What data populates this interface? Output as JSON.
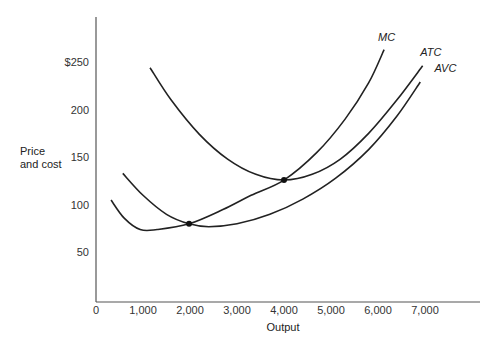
{
  "chart_data": {
    "type": "line",
    "title": "",
    "xlabel": "Output",
    "ylabel": "Price\nand cost",
    "ylabel_lines": [
      "Price",
      "and cost"
    ],
    "xlim": [
      0,
      8000
    ],
    "ylim": [
      0,
      290
    ],
    "grid": false,
    "legend": "none (curves labeled directly at their upper ends)",
    "x_ticks": [
      0,
      1000,
      2000,
      3000,
      4000,
      5000,
      6000,
      7000
    ],
    "x_tick_labels": [
      "0",
      "1,000",
      "2,000",
      "3,000",
      "4,000",
      "5,000",
      "6,000",
      "7,000"
    ],
    "y_ticks": [
      50,
      100,
      150,
      200,
      250
    ],
    "y_tick_labels": [
      "50",
      "100",
      "150",
      "200",
      "$250"
    ],
    "series": [
      {
        "name": "MC",
        "points": [
          [
            320,
            105
          ],
          [
            600,
            86
          ],
          [
            940,
            74
          ],
          [
            1300,
            74
          ],
          [
            1980,
            80
          ],
          [
            2700,
            95
          ],
          [
            3300,
            110
          ],
          [
            4000,
            126
          ],
          [
            4700,
            155
          ],
          [
            5300,
            190
          ],
          [
            5800,
            228
          ],
          [
            6130,
            263
          ]
        ]
      },
      {
        "name": "ATC",
        "points": [
          [
            1150,
            244
          ],
          [
            1600,
            210
          ],
          [
            2200,
            174
          ],
          [
            2800,
            148
          ],
          [
            3400,
            132
          ],
          [
            4000,
            126
          ],
          [
            4600,
            132
          ],
          [
            5200,
            148
          ],
          [
            5800,
            175
          ],
          [
            6400,
            210
          ],
          [
            6950,
            246
          ]
        ]
      },
      {
        "name": "AVC",
        "points": [
          [
            570,
            133
          ],
          [
            1000,
            110
          ],
          [
            1500,
            90
          ],
          [
            1980,
            80
          ],
          [
            2400,
            77
          ],
          [
            3000,
            80
          ],
          [
            3700,
            90
          ],
          [
            4400,
            106
          ],
          [
            5100,
            128
          ],
          [
            5800,
            158
          ],
          [
            6400,
            193
          ],
          [
            6900,
            229
          ]
        ]
      }
    ],
    "annotations": [
      {
        "label": "MC",
        "x": 6000,
        "y": 272
      },
      {
        "label": "ATC",
        "x": 6900,
        "y": 256
      },
      {
        "label": "AVC",
        "x": 7200,
        "y": 240
      }
    ],
    "marked_points": [
      {
        "description": "MC crosses AVC at AVC minimum region",
        "x": 1980,
        "y": 80
      },
      {
        "description": "MC crosses ATC at ATC minimum",
        "x": 4000,
        "y": 126
      }
    ]
  }
}
